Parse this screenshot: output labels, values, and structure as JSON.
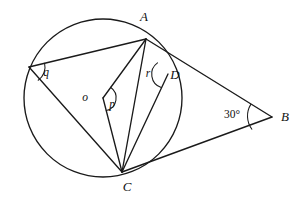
{
  "figure": {
    "type": "geometry-diagram",
    "background_color": "#ffffff",
    "stroke_color": "#1a1a1a",
    "canvas": {
      "width": 303,
      "height": 201
    }
  },
  "circle": {
    "name": "main-circle",
    "center": {
      "x": 103,
      "y": 98
    },
    "radius": 79
  },
  "points": [
    {
      "id": "A",
      "label": "A",
      "x": 146,
      "y": 39,
      "label_x": 144,
      "label_y": 21,
      "on_circle": true
    },
    {
      "id": "B",
      "label": "B",
      "x": 272,
      "y": 117,
      "label_x": 285,
      "label_y": 121,
      "on_circle": false
    },
    {
      "id": "C",
      "label": "C",
      "x": 122,
      "y": 172,
      "label_x": 127,
      "label_y": 191,
      "on_circle": true
    },
    {
      "id": "D",
      "label": "D",
      "x": 168,
      "y": 74,
      "label_x": 175,
      "label_y": 79,
      "on_circle": true
    },
    {
      "id": "Q",
      "label": "",
      "x": 29,
      "y": 67,
      "label_x": 0,
      "label_y": 0,
      "on_circle": true
    },
    {
      "id": "O",
      "label": "o",
      "x": 103,
      "y": 98,
      "label_x": 85,
      "label_y": 101,
      "on_circle": false
    }
  ],
  "segments": [
    {
      "name": "segment-Q-A",
      "from": "Q",
      "to": "A"
    },
    {
      "name": "segment-Q-C",
      "from": "Q",
      "to": "C"
    },
    {
      "name": "segment-A-O",
      "from": "A",
      "to": "O"
    },
    {
      "name": "segment-O-C",
      "from": "O",
      "to": "C"
    },
    {
      "name": "segment-A-C",
      "from": "A",
      "to": "C"
    },
    {
      "name": "segment-A-B",
      "from": "A",
      "to": "B"
    },
    {
      "name": "segment-C-B",
      "from": "C",
      "to": "B"
    },
    {
      "name": "segment-D-C",
      "from": "D",
      "to": "C"
    }
  ],
  "angles": [
    {
      "id": "q",
      "label": "q",
      "vertex": "Q",
      "label_x": 46,
      "label_y": 76,
      "arc_radius": 16
    },
    {
      "id": "p",
      "label": "p",
      "vertex": "O",
      "label_x": 112,
      "label_y": 108,
      "arc_radius": 13
    },
    {
      "id": "r",
      "label": "r",
      "vertex": "D",
      "label_x": 148,
      "label_y": 77,
      "arc_radius": 14
    },
    {
      "id": "B",
      "label": "30°",
      "vertex": "B",
      "label_x": 232,
      "label_y": 118,
      "arc_radius": 22
    }
  ],
  "center_label": {
    "text": "o",
    "x": 85,
    "y": 101
  }
}
